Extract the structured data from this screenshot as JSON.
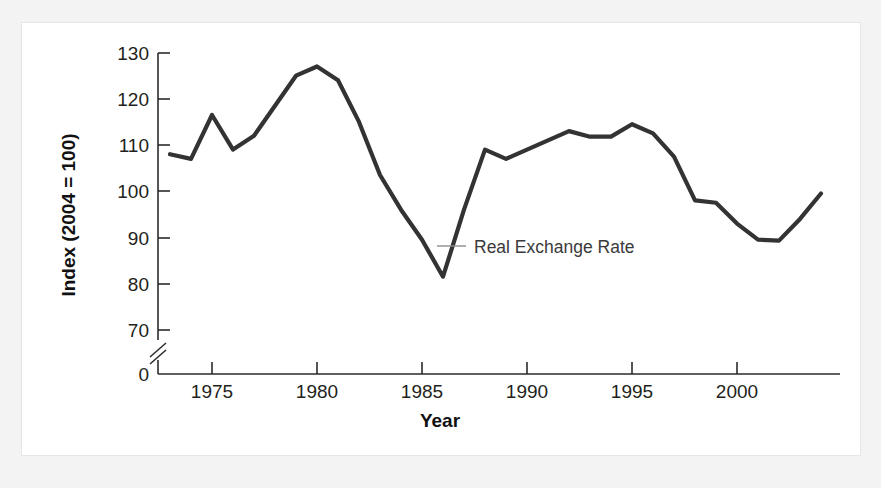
{
  "figure": {
    "background_color": "#f2f2f2",
    "panel_color": "#ffffff",
    "line_color": "#333333",
    "text_color": "#231f20"
  },
  "chart_data": {
    "type": "line",
    "title": "",
    "xlabel": "Year",
    "ylabel": "Index (2004 = 100)",
    "xlim": [
      1973,
      2004
    ],
    "ylim": [
      68,
      131
    ],
    "grid": false,
    "legend_position": "none",
    "axis_break": {
      "present": true,
      "between": [
        0,
        68
      ],
      "axis": "y"
    },
    "y_ticks": [
      0,
      70,
      80,
      90,
      100,
      110,
      120,
      130
    ],
    "y_tick_labels": [
      "0",
      "70",
      "80",
      "90",
      "100",
      "110",
      "120",
      "130"
    ],
    "x_ticks": [
      1975,
      1980,
      1985,
      1990,
      1995,
      2000
    ],
    "x_tick_labels": [
      "1975",
      "1980",
      "1985",
      "1990",
      "1995",
      "2000"
    ],
    "annotations": [
      {
        "text": "Real Exchange Rate",
        "x": 1987.2,
        "y": 89.5,
        "leader_line": true
      }
    ],
    "series": [
      {
        "name": "Real Exchange Rate",
        "x": [
          1973,
          1974,
          1975,
          1976,
          1977,
          1978,
          1979,
          1980,
          1981,
          1982,
          1983,
          1984,
          1985,
          1986,
          1987,
          1988,
          1989,
          1990,
          1991,
          1992,
          1993,
          1994,
          1995,
          1996,
          1997,
          1998,
          1999,
          2000,
          2001,
          2002,
          2003,
          2004
        ],
        "values": [
          108.0,
          107.0,
          116.5,
          109.0,
          112.0,
          118.5,
          125.0,
          127.0,
          124.0,
          115.0,
          103.5,
          96.0,
          89.5,
          81.5,
          96.0,
          109.0,
          107.0,
          109.0,
          111.0,
          113.0,
          111.8,
          111.8,
          114.5,
          112.5,
          107.5,
          98.0,
          97.5,
          93.0,
          89.5,
          89.3,
          94.0,
          99.5
        ]
      }
    ]
  }
}
